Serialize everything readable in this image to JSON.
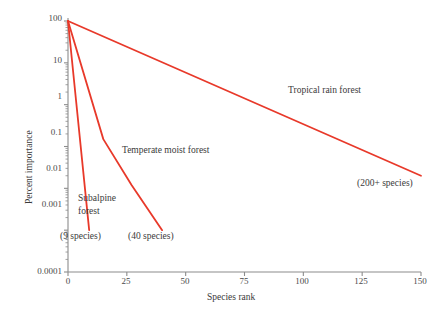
{
  "chart_data": {
    "type": "line",
    "title": "",
    "xlabel": "Species rank",
    "ylabel": "Percent importance",
    "xlim": [
      0,
      150
    ],
    "ylim": [
      0.0001,
      100
    ],
    "yscale": "log",
    "grid": false,
    "legend_position": "inline-annotations",
    "line_color": "#e8392a",
    "axis_color": "#8c8c8c",
    "xticks": [
      0,
      25,
      50,
      75,
      100,
      125,
      150
    ],
    "xtick_labels": [
      "0",
      "25",
      "50",
      "75",
      "100",
      "125",
      "150"
    ],
    "yticks": [
      100,
      10,
      1,
      0.1,
      0.01,
      0.001,
      0.0001
    ],
    "ytick_labels": [
      "100",
      "10",
      "1",
      "0.1",
      "0.01",
      "0.001",
      "0.0001"
    ],
    "series": [
      {
        "name": "Subalpine forest",
        "label": "Subalpine forest",
        "annotation": "(9 species)",
        "points": [
          [
            0,
            100
          ],
          [
            9,
            0.001
          ]
        ]
      },
      {
        "name": "Temperate moist forest",
        "label": "Temperate moist forest",
        "annotation": "(40 species)",
        "points": [
          [
            0,
            100
          ],
          [
            15,
            0.15
          ],
          [
            27,
            0.012
          ],
          [
            40,
            0.001
          ]
        ]
      },
      {
        "name": "Tropical rain forest",
        "label": "Tropical rain forest",
        "annotation": "(200+ species)",
        "points": [
          [
            0,
            100
          ],
          [
            150,
            0.02
          ]
        ]
      }
    ]
  },
  "labels": {
    "tropical": "Tropical rain forest",
    "temperate": "Temperate moist forest",
    "subalpine_line1": "Subalpine",
    "subalpine_line2": "forest",
    "count_9": "(9 species)",
    "count_40": "(40 species)",
    "count_200": "(200+ species)",
    "xaxis": "Species rank",
    "yaxis": "Percent importance"
  },
  "yticks": {
    "t100": "100",
    "t10": "10",
    "t1": "1",
    "t01": "0.1",
    "t001": "0.01",
    "t0001": "0.001",
    "t00001": "0.0001"
  },
  "xticks": {
    "t0": "0",
    "t25": "25",
    "t50": "50",
    "t75": "75",
    "t100": "100",
    "t125": "125",
    "t150": "150"
  }
}
